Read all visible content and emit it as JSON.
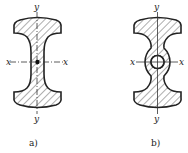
{
  "figures": [
    {
      "id": "a",
      "caption": "a)",
      "description": "I-section with concave flanges, solid web",
      "axes": {
        "horizontal": "x",
        "vertical": "y"
      },
      "center_marker": "dot"
    },
    {
      "id": "b",
      "caption": "b)",
      "description": "I-section with bulged web containing a central circular hole",
      "axes": {
        "horizontal": "x",
        "vertical": "y"
      },
      "center_marker": "circle-hole"
    }
  ],
  "colors": {
    "ink": "#222222",
    "background": "#ffffff"
  }
}
